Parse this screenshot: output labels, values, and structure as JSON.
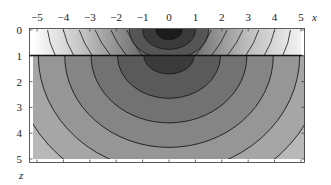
{
  "chart_data": {
    "type": "heatmap",
    "subtype": "contour",
    "title": "",
    "xlabel": "x",
    "ylabel": "z",
    "xlim": [
      -5,
      5
    ],
    "zlim": [
      0,
      5
    ],
    "z_axis_inverted": true,
    "x_ticks": [
      -5,
      -4,
      -3,
      -2,
      -1,
      0,
      1,
      2,
      3,
      4,
      5
    ],
    "z_ticks": [
      0,
      1,
      2,
      3,
      4,
      5
    ],
    "x_tick_labels": [
      "−5",
      "−4",
      "−3",
      "−2",
      "−1",
      "0",
      "1",
      "2",
      "3",
      "4",
      "5"
    ],
    "z_tick_labels": [
      "0",
      "1",
      "2",
      "3",
      "4",
      "5"
    ],
    "layer_boundary_z": 1,
    "colormap": "grayscale (dark = high value near source, light = low)",
    "source_point": {
      "x": 0,
      "z": 0
    },
    "top_layer": {
      "z_range": [
        0,
        1
      ],
      "contour_x_positions_at_top": [
        -4.6,
        -4.0,
        -3.4,
        -2.8,
        -2.2,
        -1.6,
        1.6,
        2.2,
        2.8,
        3.4,
        4.0,
        4.6
      ],
      "contour_x_positions_at_bottom": [
        -4.3,
        -3.6,
        -2.9,
        -2.2,
        -1.6,
        -1.0,
        1.0,
        1.6,
        2.2,
        2.9,
        3.6,
        4.3
      ],
      "core_contours_radius": [
        0.5,
        1.0,
        1.5
      ]
    },
    "bottom_layer": {
      "z_range": [
        1,
        5
      ],
      "contour_center": {
        "x": 0,
        "z": 1
      },
      "contour_semi_axes": [
        {
          "rx": 0.95,
          "rz": 0.7
        },
        {
          "rx": 1.95,
          "rz": 1.65
        },
        {
          "rx": 2.95,
          "rz": 2.6
        },
        {
          "rx": 3.95,
          "rz": 3.55
        },
        {
          "rx": 4.95,
          "rz": 4.5
        },
        {
          "rx": 5.9,
          "rz": 5.45
        }
      ],
      "fill_levels": [
        "#3a3a3a",
        "#5a5a5a",
        "#727272",
        "#858585",
        "#969696",
        "#a6a6a6",
        "#b8b8b8"
      ]
    },
    "grid": false,
    "legend": null
  }
}
